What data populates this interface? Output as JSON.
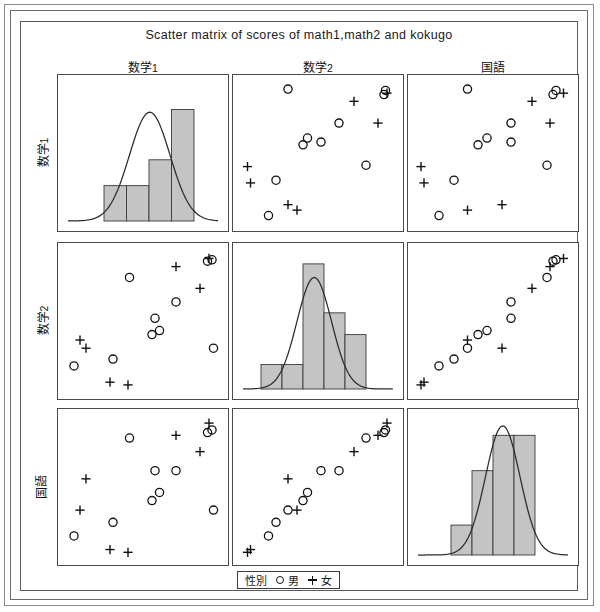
{
  "title": "Scatter matrix of scores of  math1,math2 and kokugo",
  "variables": [
    {
      "key": "math1",
      "label_main": "数学",
      "label_sub": "1",
      "label_full": "数学1"
    },
    {
      "key": "math2",
      "label_main": "数学",
      "label_sub": "2",
      "label_full": "数学2"
    },
    {
      "key": "kokugo",
      "label_main": "国語",
      "label_sub": "",
      "label_full": "国語"
    }
  ],
  "legend": {
    "title": "性別",
    "items": [
      {
        "glyph": "circle-icon",
        "label": "男"
      },
      {
        "glyph": "plus-icon",
        "label": "女"
      }
    ]
  },
  "colors": {
    "bar_fill": "#c4c4c4",
    "bar_stroke": "#3a3a3a",
    "curve": "#2b2b2b",
    "marker": "#111111",
    "panel_border": "#4a4a4a",
    "frame_border": "#6d6d6d",
    "background": "#ffffff"
  },
  "chart_data": {
    "type": "scatter",
    "title": "Scatter matrix of scores of  math1,math2 and kokugo",
    "layout": "scatter-matrix 3x3",
    "grid": false,
    "legend_position": "bottom-center",
    "axis_ticks": false,
    "variables": [
      "数学1",
      "数学2",
      "国語"
    ],
    "groups": [
      {
        "name": "男",
        "marker": "circle"
      },
      {
        "name": "女",
        "marker": "plus"
      }
    ],
    "points": [
      {
        "id": 1,
        "sex": "男",
        "math1": 0.3,
        "math2": 0.22,
        "kokugo": 0.24
      },
      {
        "id": 2,
        "sex": "男",
        "math1": 0.41,
        "math2": 0.82,
        "kokugo": 0.86
      },
      {
        "id": 3,
        "sex": "男",
        "math1": 0.58,
        "math2": 0.52,
        "kokugo": 0.62
      },
      {
        "id": 4,
        "sex": "男",
        "math1": 0.56,
        "math2": 0.4,
        "kokugo": 0.4
      },
      {
        "id": 5,
        "sex": "男",
        "math1": 0.61,
        "math2": 0.43,
        "kokugo": 0.46
      },
      {
        "id": 6,
        "sex": "男",
        "math1": 0.72,
        "math2": 0.64,
        "kokugo": 0.62
      },
      {
        "id": 7,
        "sex": "男",
        "math1": 0.96,
        "math2": 0.95,
        "kokugo": 0.92
      },
      {
        "id": 8,
        "sex": "男",
        "math1": 0.93,
        "math2": 0.94,
        "kokugo": 0.9
      },
      {
        "id": 9,
        "sex": "男",
        "math1": 0.97,
        "math2": 0.3,
        "kokugo": 0.33
      },
      {
        "id": 10,
        "sex": "男",
        "math1": 0.04,
        "math2": 0.17,
        "kokugo": 0.14
      },
      {
        "id": 11,
        "sex": "女",
        "math1": 0.28,
        "math2": 0.05,
        "kokugo": 0.04
      },
      {
        "id": 12,
        "sex": "女",
        "math1": 0.4,
        "math2": 0.03,
        "kokugo": 0.02
      },
      {
        "id": 13,
        "sex": "女",
        "math1": 0.08,
        "math2": 0.36,
        "kokugo": 0.33
      },
      {
        "id": 14,
        "sex": "女",
        "math1": 0.12,
        "math2": 0.3,
        "kokugo": 0.56
      },
      {
        "id": 15,
        "sex": "女",
        "math1": 0.72,
        "math2": 0.9,
        "kokugo": 0.88
      },
      {
        "id": 16,
        "sex": "女",
        "math1": 0.88,
        "math2": 0.74,
        "kokugo": 0.76
      },
      {
        "id": 17,
        "sex": "女",
        "math1": 0.94,
        "math2": 0.96,
        "kokugo": 0.97
      }
    ],
    "histograms": [
      {
        "variable": "数学1",
        "bins": [
          0.26,
          0.26,
          0.45,
          0.82
        ],
        "bin_left": [
          0.24,
          0.39,
          0.54,
          0.69
        ],
        "bin_width": 0.15,
        "curve": {
          "mean": 0.545,
          "sd": 0.135,
          "peak": 0.8
        }
      },
      {
        "variable": "数学2",
        "bins": [
          0.18,
          0.18,
          0.92,
          0.56,
          0.4
        ],
        "bin_left": [
          0.12,
          0.26,
          0.4,
          0.54,
          0.68
        ],
        "bin_width": 0.14,
        "curve": {
          "mean": 0.475,
          "sd": 0.115,
          "peak": 0.82
        }
      },
      {
        "variable": "国語",
        "bins": [
          0.22,
          0.62,
          0.88,
          0.88
        ],
        "bin_left": [
          0.22,
          0.36,
          0.5,
          0.64
        ],
        "bin_width": 0.14,
        "curve": {
          "mean": 0.565,
          "sd": 0.115,
          "peak": 0.95
        }
      }
    ]
  }
}
